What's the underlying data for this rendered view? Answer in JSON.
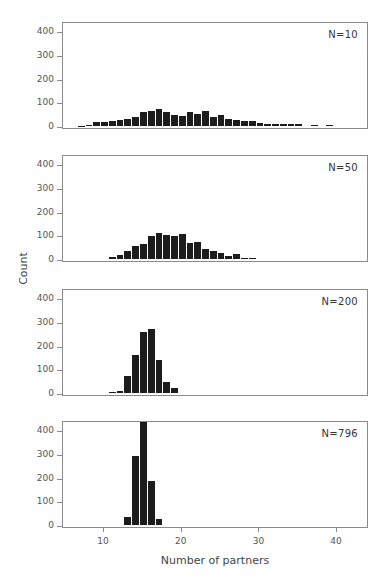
{
  "chart_data": [
    {
      "type": "bar",
      "title": "N=10",
      "xlabel": "Number of partners",
      "ylabel": "Count",
      "x": [
        7,
        8,
        9,
        10,
        11,
        12,
        13,
        14,
        15,
        16,
        17,
        18,
        19,
        20,
        21,
        22,
        23,
        24,
        25,
        26,
        27,
        28,
        29,
        30,
        31,
        32,
        33,
        34,
        35,
        36,
        37,
        38,
        39
      ],
      "values": [
        1,
        3,
        15,
        15,
        20,
        25,
        30,
        37,
        57,
        62,
        70,
        58,
        47,
        43,
        58,
        50,
        65,
        37,
        47,
        28,
        25,
        22,
        22,
        12,
        10,
        8,
        8,
        8,
        7,
        0,
        3,
        0,
        3
      ],
      "xlim": [
        5,
        44
      ],
      "ylim": [
        0,
        450
      ],
      "grid": false
    },
    {
      "type": "bar",
      "title": "N=50",
      "xlabel": "Number of partners",
      "ylabel": "Count",
      "x": [
        11,
        12,
        13,
        14,
        15,
        16,
        17,
        18,
        19,
        20,
        21,
        22,
        23,
        24,
        25,
        26,
        27,
        28,
        29
      ],
      "values": [
        10,
        18,
        33,
        55,
        65,
        98,
        108,
        103,
        95,
        107,
        68,
        70,
        42,
        35,
        25,
        12,
        20,
        5,
        3
      ],
      "xlim": [
        5,
        44
      ],
      "ylim": [
        0,
        450
      ],
      "grid": false
    },
    {
      "type": "bar",
      "title": "N=200",
      "xlabel": "Number of partners",
      "ylabel": "Count",
      "x": [
        11,
        12,
        13,
        14,
        15,
        16,
        17,
        18,
        19
      ],
      "values": [
        3,
        8,
        72,
        158,
        258,
        268,
        140,
        45,
        20
      ],
      "xlim": [
        5,
        44
      ],
      "ylim": [
        0,
        450
      ],
      "grid": false
    },
    {
      "type": "bar",
      "title": "N=796",
      "xlabel": "Number of partners",
      "ylabel": "Count",
      "x": [
        13,
        14,
        15,
        16,
        17
      ],
      "values": [
        35,
        290,
        450,
        185,
        25
      ],
      "xlim": [
        5,
        44
      ],
      "ylim": [
        0,
        450
      ],
      "grid": false
    }
  ],
  "axes": {
    "ylabel": "Count",
    "xlabel": "Number of partners",
    "yticks": [
      "400",
      "300",
      "200",
      "100",
      "0"
    ],
    "xticks": [
      "10",
      "20",
      "30",
      "40"
    ]
  },
  "panels": [
    {
      "label": "N=10"
    },
    {
      "label": "N=50"
    },
    {
      "label": "N=200"
    },
    {
      "label": "N=796"
    }
  ]
}
